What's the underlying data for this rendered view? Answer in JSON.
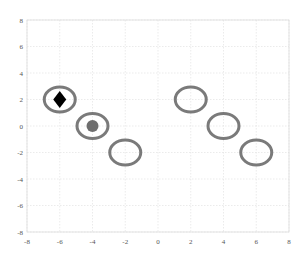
{
  "chart_data": {
    "type": "scatter",
    "title": "",
    "xlabel": "",
    "ylabel": "",
    "xlim": [
      -8,
      8
    ],
    "ylim": [
      -8,
      8
    ],
    "grid": true,
    "x_ticks": [
      "-8",
      "-6",
      "-4",
      "-2",
      "0",
      "2",
      "4",
      "6",
      "8"
    ],
    "y_ticks": [
      "8",
      "6",
      "4",
      "2",
      "0",
      "-2",
      "-4",
      "-6",
      "-8"
    ],
    "series": [
      {
        "name": "rings",
        "marker": "ellipse-outline",
        "color": "#6b6b6b",
        "points": [
          {
            "x": -6,
            "y": 2
          },
          {
            "x": -4,
            "y": 0
          },
          {
            "x": -2,
            "y": -2
          },
          {
            "x": 2,
            "y": 2
          },
          {
            "x": 4,
            "y": 0
          },
          {
            "x": 6,
            "y": -2
          }
        ]
      },
      {
        "name": "diamond",
        "marker": "diamond",
        "color": "#000000",
        "points": [
          {
            "x": -6,
            "y": 2
          }
        ]
      },
      {
        "name": "circle",
        "marker": "filled-circle",
        "color": "#6e6e6e",
        "points": [
          {
            "x": -4,
            "y": 0
          }
        ]
      }
    ]
  }
}
